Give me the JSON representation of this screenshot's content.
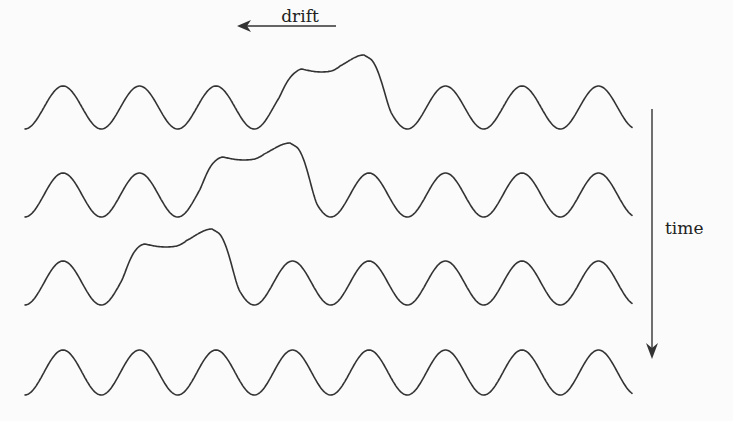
{
  "labels": {
    "drift": "drift",
    "time": "time"
  },
  "colors": {
    "stroke": "#333333",
    "text": "#222222",
    "background": "#fbfbfb"
  },
  "rows": [
    {
      "name": "row-1",
      "trough_y": 129,
      "amplitude": 43,
      "pulse_start_x": 278,
      "pulse_end_x": 392,
      "plateau_y": 69,
      "bump_peak_y": 55
    },
    {
      "name": "row-2",
      "trough_y": 217,
      "amplitude": 44,
      "pulse_start_x": 199,
      "pulse_end_x": 318,
      "plateau_y": 157,
      "bump_peak_y": 143
    },
    {
      "name": "row-3",
      "trough_y": 305,
      "amplitude": 44,
      "pulse_start_x": 121,
      "pulse_end_x": 240,
      "plateau_y": 244,
      "bump_peak_y": 229
    },
    {
      "name": "row-4",
      "trough_y": 395,
      "amplitude": 45,
      "pulse_start_x": null,
      "pulse_end_x": null
    }
  ],
  "wave": {
    "x_start": 25,
    "x_end": 632,
    "period": 76.5,
    "first_peak_x": 63
  }
}
